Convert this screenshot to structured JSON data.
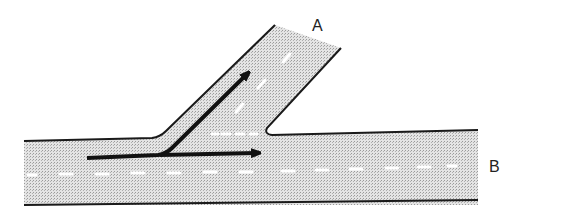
{
  "diagram": {
    "labels": {
      "branch": "A",
      "main": "B"
    },
    "colors": {
      "road_fill": "#d6d6d6",
      "road_edge": "#1a1a1a",
      "lane_marking": "#ffffff",
      "arrow": "#111111"
    }
  }
}
